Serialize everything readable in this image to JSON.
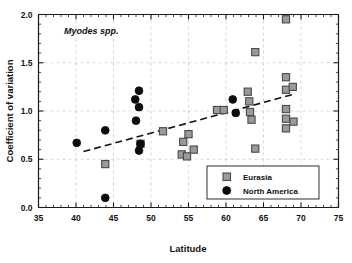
{
  "chart_data": {
    "type": "scatter",
    "title": "Myodes spp.",
    "xlabel": "Latitude",
    "ylabel": "Coefficient of variation",
    "xlim": [
      35,
      75
    ],
    "ylim": [
      0.0,
      2.0
    ],
    "xticks": [
      35,
      40,
      45,
      50,
      55,
      60,
      65,
      70,
      75
    ],
    "yticks": [
      0.0,
      0.5,
      1.0,
      1.5,
      2.0
    ],
    "xtick_labels": [
      "35",
      "40",
      "45",
      "50",
      "55",
      "60",
      "65",
      "70",
      "75"
    ],
    "ytick_labels": [
      "0.0",
      "0.5",
      "1.0",
      "1.5",
      "2.0"
    ],
    "grid": true,
    "legend_position": "bottom-right",
    "series": [
      {
        "name": "Eurasia",
        "marker": "square",
        "color": "#9a9a9a",
        "points": [
          {
            "x": 43.9,
            "y": 0.45
          },
          {
            "x": 48.6,
            "y": 0.66
          },
          {
            "x": 51.6,
            "y": 0.79
          },
          {
            "x": 54.1,
            "y": 0.55
          },
          {
            "x": 54.3,
            "y": 0.68
          },
          {
            "x": 54.8,
            "y": 0.53
          },
          {
            "x": 55.0,
            "y": 0.76
          },
          {
            "x": 55.7,
            "y": 0.6
          },
          {
            "x": 58.8,
            "y": 1.01
          },
          {
            "x": 59.7,
            "y": 1.01
          },
          {
            "x": 62.9,
            "y": 1.2
          },
          {
            "x": 63.1,
            "y": 1.1
          },
          {
            "x": 63.2,
            "y": 0.99
          },
          {
            "x": 63.4,
            "y": 0.91
          },
          {
            "x": 63.9,
            "y": 1.61
          },
          {
            "x": 63.9,
            "y": 0.61
          },
          {
            "x": 68.0,
            "y": 1.95
          },
          {
            "x": 68.0,
            "y": 1.35
          },
          {
            "x": 68.0,
            "y": 1.22
          },
          {
            "x": 68.0,
            "y": 1.02
          },
          {
            "x": 68.0,
            "y": 0.92
          },
          {
            "x": 68.0,
            "y": 0.82
          },
          {
            "x": 68.9,
            "y": 1.25
          },
          {
            "x": 69.0,
            "y": 0.89
          }
        ]
      },
      {
        "name": "North America",
        "marker": "circle",
        "color": "#0d0d0d",
        "points": [
          {
            "x": 40.1,
            "y": 0.67
          },
          {
            "x": 43.9,
            "y": 0.8
          },
          {
            "x": 43.9,
            "y": 0.1
          },
          {
            "x": 47.9,
            "y": 1.12
          },
          {
            "x": 48.0,
            "y": 0.9
          },
          {
            "x": 48.4,
            "y": 1.21
          },
          {
            "x": 48.4,
            "y": 1.04
          },
          {
            "x": 48.4,
            "y": 0.59
          },
          {
            "x": 48.6,
            "y": 0.66
          },
          {
            "x": 60.9,
            "y": 1.12
          },
          {
            "x": 61.3,
            "y": 0.98
          }
        ]
      }
    ],
    "trend_line": {
      "style": "dashed",
      "x_start": 41.0,
      "y_start": 0.58,
      "x_end": 69.3,
      "y_end": 1.18
    }
  },
  "legend": {
    "entries": [
      {
        "label": "Eurasia",
        "marker": "square"
      },
      {
        "label": "North America",
        "marker": "circle"
      }
    ]
  }
}
